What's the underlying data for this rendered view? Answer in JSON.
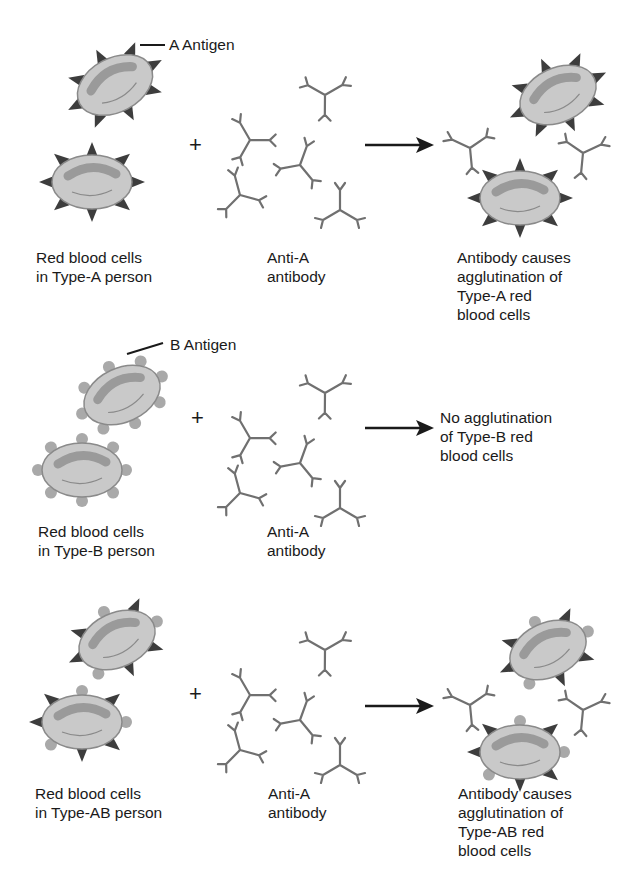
{
  "diagram": {
    "type": "blood-type-agglutination",
    "colors": {
      "cell_fill": "#c9c9c9",
      "cell_stroke": "#8a8a8a",
      "cell_center": "#9a9a9a",
      "a_antigen": "#3d3d3d",
      "b_antigen": "#a9a9a9",
      "antibody": "#707070",
      "text": "#1a1a1a"
    },
    "rows": [
      {
        "antigen_label": "A Antigen",
        "cells_label": "Red blood cells\nin Type-A person",
        "plus": "+",
        "antibody_label": "Anti-A\nantibody",
        "result_label": "Antibody causes\nagglutination of\nType-A red\nblood cells"
      },
      {
        "antigen_label": "B Antigen",
        "cells_label": "Red blood cells\nin Type-B person",
        "plus": "+",
        "antibody_label": "Anti-A\nantibody",
        "result_label": "No agglutination\nof Type-B red\nblood cells"
      },
      {
        "cells_label": "Red blood cells\nin Type-AB person",
        "plus": "+",
        "antibody_label": "Anti-A\nantibody",
        "result_label": "Antibody causes\nagglutination of\nType-AB red\nblood cells"
      }
    ]
  }
}
